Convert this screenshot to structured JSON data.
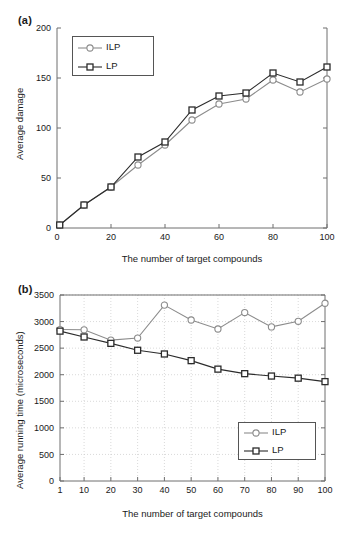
{
  "figure": {
    "panel_a_label": "(a)",
    "panel_b_label": "(b)",
    "shared_xlabel": "The number of target compounds"
  },
  "chart_data": [
    {
      "id": "panel-a",
      "type": "line",
      "title": "",
      "panel_label": "(a)",
      "xlabel": "The number of target compounds",
      "ylabel": "Average damage",
      "xlim": [
        0,
        100
      ],
      "ylim": [
        0,
        200
      ],
      "xticks": [
        0,
        20,
        40,
        60,
        80,
        100
      ],
      "yticks": [
        0,
        50,
        100,
        150,
        200
      ],
      "grid": false,
      "legend_position": "top-left",
      "x": [
        1,
        10,
        20,
        30,
        40,
        50,
        60,
        70,
        80,
        90,
        100
      ],
      "series": [
        {
          "name": "ILP",
          "marker": "circle",
          "color": "#8c8c8c",
          "values": [
            3,
            23,
            41,
            63,
            83,
            108,
            124,
            129,
            148,
            136,
            149
          ]
        },
        {
          "name": "LP",
          "marker": "square",
          "color": "#2b2b2b",
          "values": [
            3,
            23,
            41,
            71,
            86,
            118,
            132,
            135,
            155,
            146,
            161
          ]
        }
      ]
    },
    {
      "id": "panel-b",
      "type": "line",
      "title": "",
      "panel_label": "(b)",
      "xlabel": "The number of target compounds",
      "ylabel": "Average running time (microseconds)",
      "xlim": [
        1,
        100
      ],
      "ylim": [
        0,
        3500
      ],
      "xticks": [
        1,
        10,
        20,
        30,
        40,
        50,
        60,
        70,
        80,
        90,
        100
      ],
      "yticks": [
        0,
        500,
        1000,
        1500,
        2000,
        2500,
        3000,
        3500
      ],
      "grid": true,
      "legend_position": "bottom-right",
      "x": [
        1,
        10,
        20,
        30,
        40,
        50,
        60,
        70,
        80,
        90,
        100
      ],
      "series": [
        {
          "name": "ILP",
          "marker": "circle",
          "color": "#8c8c8c",
          "values": [
            2850,
            2845,
            2650,
            2690,
            3310,
            3030,
            2860,
            3170,
            2900,
            3005,
            3345
          ]
        },
        {
          "name": "LP",
          "marker": "square",
          "color": "#2b2b2b",
          "values": [
            2820,
            2710,
            2590,
            2460,
            2390,
            2265,
            2105,
            2020,
            1975,
            1935,
            1870
          ]
        }
      ]
    }
  ],
  "legend_a": {
    "items": [
      {
        "label": "ILP",
        "marker": "circle",
        "color": "#8c8c8c"
      },
      {
        "label": "LP",
        "marker": "square",
        "color": "#2b2b2b"
      }
    ]
  },
  "legend_b": {
    "items": [
      {
        "label": "ILP",
        "marker": "circle",
        "color": "#8c8c8c"
      },
      {
        "label": "LP",
        "marker": "square",
        "color": "#2b2b2b"
      }
    ]
  },
  "caption_partial": ""
}
